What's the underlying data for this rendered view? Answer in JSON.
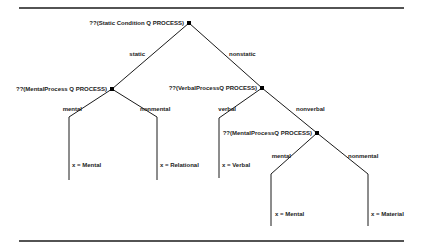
{
  "diagram": {
    "type": "decision-tree",
    "nodes": [
      {
        "id": "root",
        "label": "??(Static Condition Q PROCESS)"
      },
      {
        "id": "mental1",
        "label": "??(MentalProcess Q PROCESS)"
      },
      {
        "id": "verbal",
        "label": "??(VerbalProcessQ PROCESS)"
      },
      {
        "id": "mental2",
        "label": "??(MentalProcessQ PROCESS)"
      }
    ],
    "edges": [
      {
        "from": "root",
        "to": "mental1",
        "label": "static"
      },
      {
        "from": "root",
        "to": "verbal",
        "label": "nonstatic"
      },
      {
        "from": "mental1",
        "to": "leaf_mental1",
        "label": "mental"
      },
      {
        "from": "mental1",
        "to": "leaf_relational",
        "label": "nonmental"
      },
      {
        "from": "verbal",
        "to": "leaf_verbal",
        "label": "verbal"
      },
      {
        "from": "verbal",
        "to": "mental2",
        "label": "nonverbal"
      },
      {
        "from": "mental2",
        "to": "leaf_mental2",
        "label": "mental"
      },
      {
        "from": "mental2",
        "to": "leaf_material",
        "label": "nonmental"
      }
    ],
    "leaves": [
      {
        "id": "leaf_mental1",
        "label": "x = Mental"
      },
      {
        "id": "leaf_relational",
        "label": "x = Relational"
      },
      {
        "id": "leaf_verbal",
        "label": "x = Verbal"
      },
      {
        "id": "leaf_mental2",
        "label": "x = Mental"
      },
      {
        "id": "leaf_material",
        "label": "x = Material"
      }
    ]
  }
}
